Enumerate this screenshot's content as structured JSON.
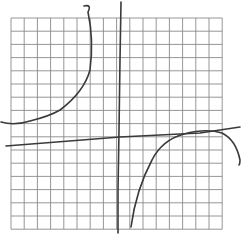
{
  "figure": {
    "background": "#ffffff",
    "grid": {
      "columns": 16,
      "rows": 16,
      "left": 11,
      "top": 18,
      "cell": 13.2,
      "color": "#8a8a8a"
    },
    "pen_color": "#3a3a3a",
    "strokes": [
      {
        "name": "horizontal-line",
        "path": "M 6 146 L 120 137 L 200 133 L 240 127"
      },
      {
        "name": "vertical-line",
        "path": "M 121 2 L 120 60 L 119 130 L 118 190 L 118 233"
      },
      {
        "name": "left-branch-curve",
        "path": "M 84 6 Q 92 4 88 12 Q 94 40 90 70 Q 84 92 60 110 Q 50 116 30 121 Q 14 126 1 122"
      },
      {
        "name": "right-branch-curve",
        "path": "M 131 227 Q 136 190 152 160 Q 162 140 184 134 Q 206 128 222 133 Q 236 140 240 160 Q 240 164 239 165"
      }
    ]
  }
}
